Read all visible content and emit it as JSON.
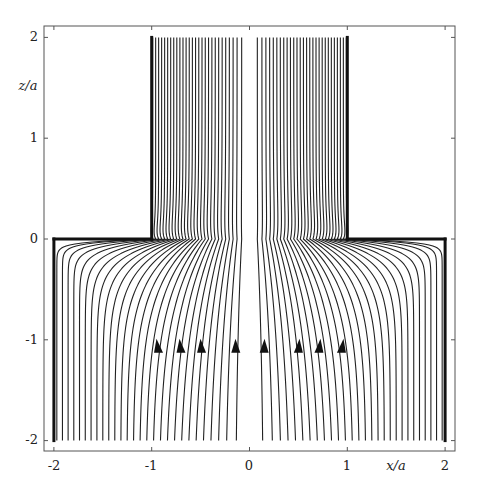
{
  "chart_data": {
    "type": "line",
    "title": "",
    "xlabel": "x/a",
    "ylabel": "z/a",
    "xlim": [
      -2.1,
      2.1
    ],
    "ylim": [
      -2.12,
      2.12
    ],
    "xticks": [
      -2,
      -1,
      0,
      1,
      2
    ],
    "yticks": [
      -2,
      -1,
      0,
      1,
      2
    ],
    "xtick_labels": [
      "-2",
      "-1",
      "0",
      "1",
      "2"
    ],
    "ytick_labels": [
      "-2",
      "-1",
      "0",
      "1",
      "2"
    ],
    "grid": false,
    "legend": null,
    "geometry": {
      "description": "Streamlines of flow from a wide lower region (|x|<2, -2<z<0) contracting into a narrow upper channel (|x|<1, 0<z<2)",
      "walls": [
        {
          "name": "left-outer-wall",
          "points": [
            [
              -2,
              -2
            ],
            [
              -2,
              0
            ]
          ]
        },
        {
          "name": "left-step-wall",
          "points": [
            [
              -2,
              0
            ],
            [
              -1,
              0
            ]
          ]
        },
        {
          "name": "left-channel-wall",
          "points": [
            [
              -1,
              0
            ],
            [
              -1,
              2
            ]
          ]
        },
        {
          "name": "right-outer-wall",
          "points": [
            [
              2,
              -2
            ],
            [
              2,
              0
            ]
          ]
        },
        {
          "name": "right-step-wall",
          "points": [
            [
              2,
              0
            ],
            [
              1,
              0
            ]
          ]
        },
        {
          "name": "right-channel-wall",
          "points": [
            [
              1,
              0
            ],
            [
              1,
              2
            ]
          ]
        }
      ],
      "lower_half_width": 2,
      "channel_half_width": 1,
      "z_bottom": -2,
      "z_top": 2
    },
    "streamlines": {
      "count_per_side": 28,
      "symmetric": true,
      "flow_direction": "upward",
      "bottom_x_range": [
        0.15,
        1.97
      ],
      "top_x_range": [
        0.08,
        0.99
      ]
    },
    "arrows": {
      "z": -1.05,
      "x": [
        -0.93,
        -0.7,
        -0.49,
        -0.14,
        0.15,
        0.5,
        0.71,
        0.94
      ],
      "direction": "up"
    }
  }
}
